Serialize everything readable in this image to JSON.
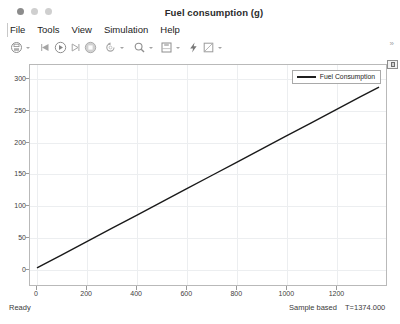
{
  "window": {
    "title": "Fuel consumption (g)",
    "controls": [
      "close",
      "minimize",
      "maximize"
    ]
  },
  "menubar": {
    "items": [
      {
        "label": "File"
      },
      {
        "label": "Tools"
      },
      {
        "label": "View"
      },
      {
        "label": "Simulation"
      },
      {
        "label": "Help"
      }
    ]
  },
  "toolbar": {
    "buttons": [
      {
        "name": "print-icon",
        "has_caret": true
      },
      {
        "name": "rewind-icon",
        "has_caret": false
      },
      {
        "name": "run-icon",
        "has_caret": false
      },
      {
        "name": "step-forward-icon",
        "has_caret": false
      },
      {
        "name": "stop-icon",
        "has_caret": false
      },
      {
        "name": "restore-view-icon",
        "has_caret": true
      },
      {
        "name": "zoom-icon",
        "has_caret": true
      },
      {
        "name": "layout-icon",
        "has_caret": true
      },
      {
        "name": "highlight-signal-icon",
        "has_caret": false
      },
      {
        "name": "annotation-icon",
        "has_caret": true
      }
    ],
    "overflow_label": "»"
  },
  "plot": {
    "float_badge": "undock-icon"
  },
  "statusbar": {
    "state": "Ready",
    "mode": "Sample based",
    "time": "T=1374.000"
  },
  "chart_data": {
    "type": "line",
    "title": "Fuel consumption (g)",
    "xlabel": "",
    "ylabel": "",
    "xlim": [
      -28,
      1402
    ],
    "ylim": [
      -27,
      322
    ],
    "xticks": [
      0,
      200,
      400,
      600,
      800,
      1000,
      1200
    ],
    "xtick_labels": [
      "0",
      "200",
      "400",
      "600",
      "800",
      "1000",
      "1200"
    ],
    "yticks": [
      0,
      50,
      100,
      150,
      200,
      250,
      300
    ],
    "ytick_labels": [
      "0",
      "50",
      "100",
      "150",
      "200",
      "250",
      "300"
    ],
    "grid": true,
    "legend_position": "top-right",
    "series": [
      {
        "name": "Fuel Consumption",
        "color": "#1a1a1a",
        "width": 1.4,
        "x": [
          0,
          100,
          200,
          300,
          400,
          500,
          600,
          700,
          800,
          900,
          1000,
          1100,
          1200,
          1300,
          1374
        ],
        "y": [
          0,
          20.9,
          41.8,
          62.7,
          83.6,
          104.5,
          125.4,
          146.3,
          167.2,
          188.1,
          209.0,
          229.9,
          250.8,
          271.7,
          287.0
        ]
      }
    ]
  }
}
